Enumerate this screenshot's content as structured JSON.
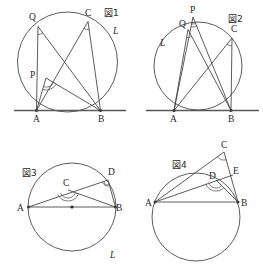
{
  "page": {
    "width": 263,
    "height": 275,
    "background": "#ffffff",
    "ink_color": "#3a3a3a"
  },
  "figures": [
    {
      "id": "fig1",
      "caption": "図1",
      "caption_pos": {
        "x": 104,
        "y": 16
      },
      "circle": {
        "cx": 67.5,
        "cy": 62,
        "r": 50
      },
      "tangent_line": {
        "x1": 14,
        "y1": 110.5,
        "x2": 126,
        "y2": 110.5
      },
      "line_label": {
        "text": "L",
        "x": 113,
        "y": 34
      },
      "points": [
        {
          "name": "A",
          "x": 36.5,
          "y": 110.5,
          "label_x": 33,
          "label_y": 122,
          "dot": true
        },
        {
          "name": "B",
          "x": 100.5,
          "y": 110.5,
          "label_x": 98,
          "label_y": 122,
          "dot": true
        },
        {
          "name": "C",
          "x": 88,
          "y": 21.5,
          "label_x": 85,
          "label_y": 16,
          "dot": false
        },
        {
          "name": "Q",
          "x": 38,
          "y": 26.5,
          "label_x": 29,
          "label_y": 20,
          "dot": false
        },
        {
          "name": "P",
          "x": 46,
          "y": 78,
          "label_x": 30,
          "label_y": 78,
          "dot": false
        }
      ],
      "segments": [
        {
          "from": "Q",
          "to": "A"
        },
        {
          "from": "Q",
          "to": "B"
        },
        {
          "from": "C",
          "to": "A"
        },
        {
          "from": "C",
          "to": "B"
        },
        {
          "from": "P",
          "to": "A"
        },
        {
          "from": "P",
          "to": "B"
        }
      ],
      "angle_marks": [
        {
          "vertex": "Q",
          "to_a": "A",
          "to_b": "B",
          "radius": 8,
          "double": false
        },
        {
          "vertex": "C",
          "to_a": "A",
          "to_b": "B",
          "radius": 8,
          "double": false
        },
        {
          "vertex": "P",
          "to_a": "A",
          "to_b": "B",
          "radius": 9,
          "double": true
        }
      ]
    },
    {
      "id": "fig2",
      "caption": "図2",
      "caption_pos": {
        "x": 228,
        "y": 22
      },
      "circle": {
        "cx": 198,
        "cy": 66,
        "r": 44
      },
      "tangent_line": {
        "x1": 146,
        "y1": 110.5,
        "x2": 259,
        "y2": 110.5
      },
      "line_label": {
        "text": "L",
        "x": 160,
        "y": 46
      },
      "points": [
        {
          "name": "A",
          "x": 174,
          "y": 110.5,
          "label_x": 170,
          "label_y": 122,
          "dot": true
        },
        {
          "name": "B",
          "x": 231,
          "y": 110.5,
          "label_x": 228,
          "label_y": 122,
          "dot": true
        },
        {
          "name": "C",
          "x": 232,
          "y": 38,
          "label_x": 231,
          "label_y": 32,
          "dot": false
        },
        {
          "name": "Q",
          "x": 188,
          "y": 29.5,
          "label_x": 179,
          "label_y": 27,
          "dot": false
        },
        {
          "name": "P",
          "x": 193,
          "y": 17,
          "label_x": 190,
          "label_y": 13,
          "dot": false
        }
      ],
      "segments": [
        {
          "from": "Q",
          "to": "A"
        },
        {
          "from": "Q",
          "to": "B"
        },
        {
          "from": "C",
          "to": "A"
        },
        {
          "from": "C",
          "to": "B"
        },
        {
          "from": "P",
          "to": "A"
        },
        {
          "from": "P",
          "to": "B"
        }
      ],
      "angle_marks": [
        {
          "vertex": "Q",
          "to_a": "A",
          "to_b": "B",
          "radius": 8,
          "double": false
        },
        {
          "vertex": "C",
          "to_a": "A",
          "to_b": "B",
          "radius": 8,
          "double": false
        },
        {
          "vertex": "P",
          "to_a": "A",
          "to_b": "B",
          "radius": 7,
          "double": true
        }
      ]
    },
    {
      "id": "fig3",
      "caption": "図3",
      "caption_pos": {
        "x": 22,
        "y": 176
      },
      "circle": {
        "cx": 72,
        "cy": 207,
        "r": 44
      },
      "center_dot": {
        "cx": 72,
        "cy": 207,
        "r": 1.6
      },
      "line_label": {
        "text": "L",
        "x": 110,
        "y": 258
      },
      "points": [
        {
          "name": "A",
          "x": 28.5,
          "y": 207,
          "label_x": 17,
          "label_y": 211,
          "dot": true
        },
        {
          "name": "B",
          "x": 115.5,
          "y": 207,
          "label_x": 116,
          "label_y": 211,
          "dot": true
        },
        {
          "name": "D",
          "x": 108,
          "y": 180,
          "label_x": 108,
          "label_y": 175,
          "dot": false
        },
        {
          "name": "C",
          "x": 68,
          "y": 190,
          "label_x": 63,
          "label_y": 186,
          "dot": false
        }
      ],
      "segments": [
        {
          "from": "A",
          "to": "B"
        },
        {
          "from": "A",
          "to": "D"
        },
        {
          "from": "D",
          "to": "B"
        },
        {
          "from": "C",
          "to": "B"
        }
      ],
      "angle_marks": [
        {
          "vertex": "C",
          "to_a": "A",
          "to_b": "B",
          "radius": 8,
          "double": true
        },
        {
          "vertex": "D",
          "to_a": "A",
          "to_b": "B",
          "radius": 6,
          "double": false,
          "square": true
        }
      ]
    },
    {
      "id": "fig4",
      "caption": "図4",
      "caption_pos": {
        "x": 172,
        "y": 168
      },
      "circle": {
        "cx": 196,
        "cy": 217,
        "r": 44
      },
      "line_label": {
        "text": "",
        "x": 0,
        "y": 0
      },
      "points": [
        {
          "name": "A",
          "x": 155,
          "y": 202,
          "label_x": 145,
          "label_y": 206,
          "dot": true
        },
        {
          "name": "B",
          "x": 238,
          "y": 202,
          "label_x": 241,
          "label_y": 206,
          "dot": true
        },
        {
          "name": "C",
          "x": 224,
          "y": 152,
          "label_x": 221,
          "label_y": 148,
          "dot": false
        },
        {
          "name": "D",
          "x": 216,
          "y": 180,
          "label_x": 209,
          "label_y": 179,
          "dot": false
        },
        {
          "name": "E",
          "x": 233,
          "y": 175,
          "label_x": 233,
          "label_y": 174,
          "dot": false
        }
      ],
      "segments": [
        {
          "from": "A",
          "to": "B"
        },
        {
          "from": "A",
          "to": "C"
        },
        {
          "from": "A",
          "to": "E"
        },
        {
          "from": "C",
          "to": "B"
        },
        {
          "from": "D",
          "to": "B"
        }
      ],
      "angle_marks": [
        {
          "vertex": "C",
          "to_a": "A",
          "to_b": "B",
          "radius": 8,
          "double": false
        },
        {
          "vertex": "D",
          "to_a": "A",
          "to_b": "B",
          "radius": 8,
          "double": true
        }
      ]
    }
  ]
}
